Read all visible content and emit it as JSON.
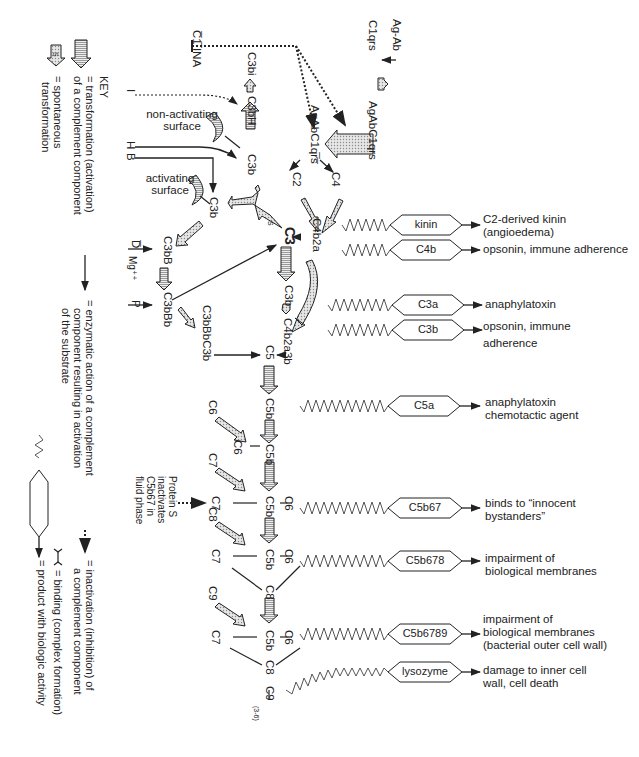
{
  "diagram": {
    "orientation": "rotated 90 degrees clockwise",
    "classical_pathway": {
      "ag_ab": "Ag-Ab",
      "c1qrs": "C1qrs",
      "agabc1qrs": "AgAbC1qrs",
      "agabc1qrs_activated": "AgAbC1qr̅s̅",
      "c4": "C4",
      "c2": "C2",
      "c4b2a": "C4b2a",
      "c3": "C3",
      "c3b": "C3b",
      "c4b2a3b": "C4b2a3b",
      "c1_ina": "C̅1̅ INA"
    },
    "alternative_pathway": {
      "i_label": "I",
      "h_label": "H",
      "b_label": "B",
      "c3bi": "C3bi",
      "c3bh": "C3bH",
      "c3b_top": "C3b",
      "c3b_left": "C3b",
      "non_activating_surface": [
        "non-activating",
        "surface"
      ],
      "activating_surface": [
        "activating",
        "surface"
      ],
      "c3bb": "C3bB",
      "d_label": "D̅",
      "mg_label": "Mg⁺⁺",
      "p_label": "P",
      "c3bbb": "C3bBb",
      "c3bbbc3b": "C3bBbC3b",
      "spontaneous_s": "S"
    },
    "terminal_pathway": {
      "c5": "C5",
      "c5b": "C5b",
      "c6": "C6",
      "c7": "C7",
      "c8": "C8",
      "c9": "C9",
      "c9_subscript": "(3-6)",
      "protein_s_note": [
        "Protein  S",
        "inactivates",
        "C5b67 in",
        "fluid phase"
      ]
    },
    "products": [
      {
        "name": "kinin",
        "activity": [
          "C2-derived kinin",
          "(angioedema)"
        ]
      },
      {
        "name": "C4b",
        "activity": [
          "opsonin, immune adherence"
        ]
      },
      {
        "name": "C3a",
        "activity": [
          "anaphylatoxin"
        ]
      },
      {
        "name": "C3b",
        "activity": [
          "opsonin, immune",
          "adherence"
        ]
      },
      {
        "name": "C5a",
        "activity": [
          "anaphylatoxin",
          "chemotactic agent"
        ]
      },
      {
        "name": "C5b67",
        "activity": [
          "binds to “innocent",
          "bystanders”"
        ]
      },
      {
        "name": "C5b678",
        "activity": [
          "impairment of",
          "biological membranes"
        ]
      },
      {
        "name": "C5b6789",
        "activity": [
          "impairment of",
          "biological membranes",
          "(bacterial outer cell wall)"
        ]
      },
      {
        "name": "lysozyme",
        "activity": [
          "damage to inner cell",
          "wall, cell death"
        ]
      }
    ],
    "key": {
      "title": "KEY",
      "transformation": [
        "= transformation (activation)",
        "of a complement component"
      ],
      "spontaneous": [
        "= spontaneous",
        "transformation"
      ],
      "spontaneous_s": "S",
      "enzymatic": [
        "= enzymatic action of a complement",
        "component resulting in activation",
        "of the substrate"
      ],
      "inactivation": [
        "= inactivation (inhibition) of",
        "a complement component"
      ],
      "binding": [
        "= binding (complex formation)"
      ],
      "product": [
        "= product with biologic activity"
      ]
    },
    "colors": {
      "ink": "#222222",
      "arrow_fill": "#c8c8c8",
      "background": "#ffffff"
    }
  }
}
